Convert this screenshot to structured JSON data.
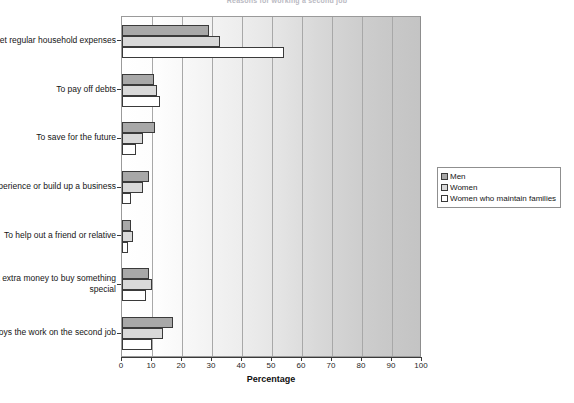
{
  "chart_data": {
    "type": "bar",
    "orientation": "horizontal",
    "title": "Reasons for working a second job",
    "xlabel": "Percentage",
    "ylabel": "",
    "xlim": [
      0,
      100
    ],
    "xticks": [
      0,
      10,
      20,
      30,
      40,
      50,
      60,
      70,
      80,
      90,
      100
    ],
    "grid": true,
    "legend_position": "right",
    "categories": [
      "To meet regular household expenses",
      "To pay off debts",
      "To save for the future",
      "To get experience or build up a business",
      "To help out a friend or relative",
      "To get extra money to buy something special",
      "Enjoys the work on the second job"
    ],
    "series": [
      {
        "name": "Men",
        "color": "#a8a8a8",
        "values": [
          29.0,
          10.5,
          11.0,
          9.0,
          3.0,
          9.0,
          17.0
        ]
      },
      {
        "name": "Women",
        "color": "#d9d9d9",
        "values": [
          32.5,
          11.5,
          7.0,
          7.0,
          3.5,
          10.0,
          13.5
        ]
      },
      {
        "name": "Women who maintain families",
        "color": "#ffffff",
        "values": [
          54.0,
          12.5,
          4.5,
          3.0,
          2.0,
          8.0,
          10.0
        ]
      }
    ]
  }
}
